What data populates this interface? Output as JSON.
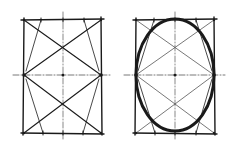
{
  "diagram": {
    "title": "",
    "colors": {
      "ink": "#1a1a1a",
      "light": "#555555",
      "background": "#ffffff"
    },
    "figures": [
      {
        "id": "construction",
        "rect": {
          "x1": 24,
          "y1": 20,
          "x2": 101,
          "y2": 133
        },
        "center": {
          "x": 63,
          "y": 75
        },
        "vertical_axis": {
          "y1": 12,
          "y2": 141
        },
        "horizontal_axis": {
          "x1": 13,
          "x2": 111
        },
        "top_marks": [
          41,
          84
        ],
        "bottom_marks": [
          43,
          83
        ],
        "ellipse": null
      },
      {
        "id": "ellipse-drawn",
        "rect": {
          "x1": 136,
          "y1": 20,
          "x2": 214,
          "y2": 133
        },
        "center": {
          "x": 175,
          "y": 75
        },
        "vertical_axis": {
          "y1": 12,
          "y2": 141
        },
        "horizontal_axis": {
          "x1": 124,
          "x2": 225
        },
        "top_marks": [
          154,
          196
        ],
        "bottom_marks": [
          155,
          196
        ],
        "ellipse": {
          "rx": 39,
          "ry": 56
        }
      }
    ]
  }
}
